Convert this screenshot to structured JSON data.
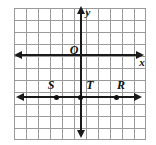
{
  "figure": {
    "type": "coordinate-plane",
    "width": 156,
    "height": 145,
    "background_color": "#ffffff",
    "grid": {
      "visible": true,
      "cell_size_px": 12,
      "columns": 11,
      "rows": 11,
      "line_color": "#9a9a9a"
    },
    "axes": {
      "color": "#1a1a1a",
      "x_axis": {
        "label": "x",
        "arrowheads": "both"
      },
      "y_axis": {
        "label": "y",
        "arrowheads": "both"
      },
      "origin": {
        "label": "O"
      }
    },
    "line": {
      "description": "horizontal line below the x-axis",
      "arrowheads": "both",
      "color": "#1a1a1a"
    },
    "points": [
      {
        "label": "S",
        "cx": 56,
        "cy": 96,
        "label_x": 51,
        "label_y": 85
      },
      {
        "label": "T",
        "cx": 80,
        "cy": 96,
        "label_x": 79,
        "label_y": 85
      },
      {
        "label": "R",
        "cx": 116,
        "cy": 96,
        "label_x": 121,
        "label_y": 85
      }
    ]
  }
}
